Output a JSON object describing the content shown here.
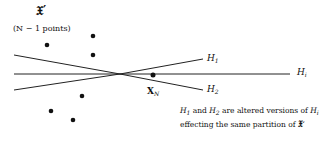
{
  "set_label": "𝔛′",
  "set_note": "(N − 1 points)",
  "hyperplanes": {
    "h1": {
      "main": "H",
      "sub": "1"
    },
    "h2": {
      "main": "H",
      "sub": "2"
    },
    "hi": {
      "main": "H",
      "sub": "i"
    }
  },
  "point_label": {
    "main": "X",
    "sub": "N"
  },
  "caption": {
    "line1_part1": "H",
    "line1_sub1": "1",
    "line1_and": " and ",
    "line1_part2": "H",
    "line1_sub2": "2",
    "line1_rest": " are altered versions of ",
    "line1_part3": "H",
    "line1_sub3": "i",
    "line2": "effecting the same partition of ",
    "line2_set": "𝔛′"
  },
  "colors": {
    "ink": "#111111",
    "background": "#ffffff"
  }
}
